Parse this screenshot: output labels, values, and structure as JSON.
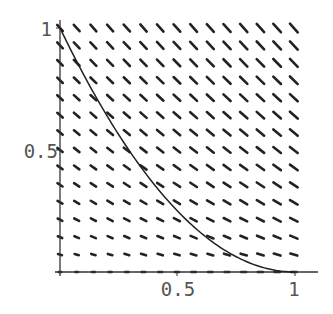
{
  "chart_data": {
    "type": "vector_field",
    "title": "",
    "xlabel": "",
    "ylabel": "",
    "xlim": [
      0,
      1
    ],
    "ylim": [
      0,
      1
    ],
    "grid": false,
    "x_ticks": [
      {
        "value": 0.5,
        "label": "0.5"
      },
      {
        "value": 1,
        "label": "1"
      }
    ],
    "y_ticks": [
      {
        "value": 0.5,
        "label": "0.5"
      },
      {
        "value": 1,
        "label": "1"
      }
    ],
    "field": {
      "rows": 15,
      "cols": 15,
      "description": "Direction field with arrows pointing down-right; slope steeper near x=0, flattening to horizontal at y=0"
    },
    "curve": {
      "description": "Solution curve from (0,1) to (1,0), approximately y = (1 - x)^2",
      "points": [
        [
          0,
          1
        ],
        [
          0.1,
          0.81
        ],
        [
          0.2,
          0.64
        ],
        [
          0.3,
          0.49
        ],
        [
          0.4,
          0.36
        ],
        [
          0.5,
          0.25
        ],
        [
          0.6,
          0.16
        ],
        [
          0.7,
          0.09
        ],
        [
          0.8,
          0.04
        ],
        [
          0.9,
          0.01
        ],
        [
          1,
          0
        ]
      ]
    },
    "colors": {
      "arrows": "#222222",
      "axes": "#333333",
      "curve": "#222222",
      "labels": "#555555"
    }
  }
}
